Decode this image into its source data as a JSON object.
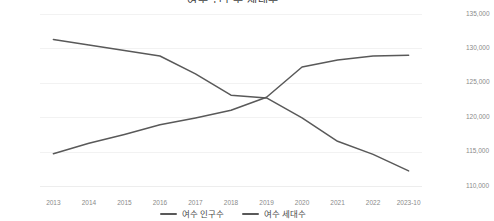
{
  "chart_data": {
    "type": "line",
    "title": "여수 인구수 세대수",
    "xlabel": "",
    "ylabel": "",
    "grid": true,
    "legend_position": "bottom",
    "categories": [
      "2013",
      "2014",
      "2015",
      "2016",
      "2017",
      "2018",
      "2019",
      "2020",
      "2021",
      "2022",
      "2023-10"
    ],
    "axes": {
      "left": {
        "label": "여수 인구수",
        "min": 270000,
        "max": 295000,
        "step": 5000,
        "ticks": [
          "270,000",
          "275,000",
          "280,000",
          "285,000",
          "290,000",
          "295,000"
        ]
      },
      "right": {
        "label": "여수 세대수",
        "min": 110000,
        "max": 135000,
        "step": 5000,
        "ticks": [
          "110,000",
          "115,000",
          "120,000",
          "125,000",
          "130,000",
          "135,000"
        ]
      }
    },
    "series": [
      {
        "name": "여수 인구수",
        "axis": "left",
        "color": "#595959",
        "values": [
          291300,
          290500,
          289700,
          288900,
          286300,
          283200,
          282800,
          279900,
          276500,
          274600,
          272200
        ]
      },
      {
        "name": "여수 세대수",
        "axis": "right",
        "color": "#595959",
        "values": [
          114700,
          116200,
          117500,
          118900,
          119900,
          121000,
          122900,
          127300,
          128300,
          128900,
          129000
        ]
      }
    ]
  },
  "legend": {
    "items": [
      {
        "label": "여수 인구수"
      },
      {
        "label": "여수 세대수"
      }
    ]
  }
}
